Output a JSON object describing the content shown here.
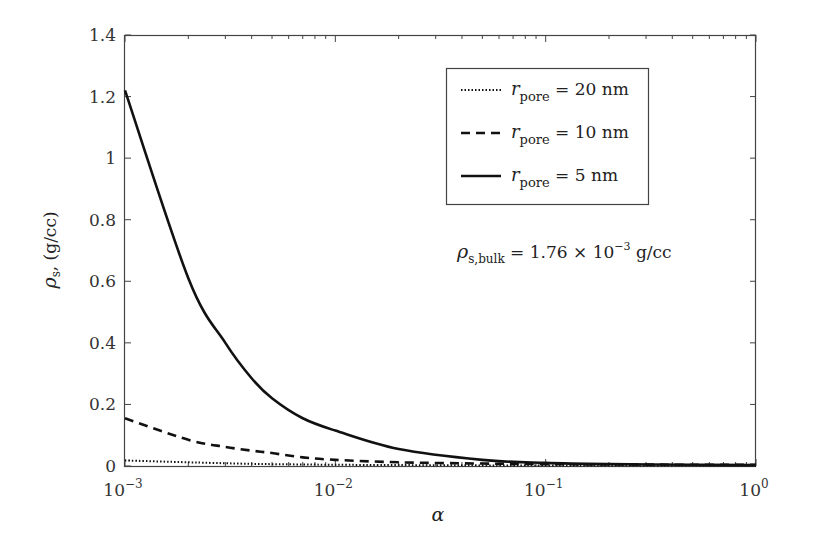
{
  "chart_data": {
    "type": "line",
    "title": "",
    "xlabel": "α",
    "ylabel": "ρs, (g/cc)",
    "xscale": "log",
    "xlim": [
      0.001,
      1
    ],
    "ylim": [
      0,
      1.4
    ],
    "grid": false,
    "legend_position": "upper right (inside)",
    "x_ticks": [
      {
        "value": 0.001,
        "base": "10",
        "exp": "−3"
      },
      {
        "value": 0.01,
        "base": "10",
        "exp": "−2"
      },
      {
        "value": 0.1,
        "base": "10",
        "exp": "−1"
      },
      {
        "value": 1,
        "base": "10",
        "exp": "0"
      }
    ],
    "y_ticks": [
      {
        "value": 0,
        "label": "0"
      },
      {
        "value": 0.2,
        "label": "0.2"
      },
      {
        "value": 0.4,
        "label": "0.4"
      },
      {
        "value": 0.6,
        "label": "0.6"
      },
      {
        "value": 0.8,
        "label": "0.8"
      },
      {
        "value": 1.0,
        "label": "1"
      },
      {
        "value": 1.2,
        "label": "1.2"
      },
      {
        "value": 1.4,
        "label": "1.4"
      }
    ],
    "x": [
      0.001,
      0.002,
      0.003,
      0.004,
      0.005,
      0.007,
      0.01,
      0.02,
      0.05,
      0.1,
      0.2,
      0.5,
      1
    ],
    "series": [
      {
        "name": "r_pore = 20 nm",
        "legend_main": "r",
        "legend_sub": "pore",
        "legend_rest": " = 20 nm",
        "style": "dotted",
        "values": [
          0.018,
          0.012,
          0.009,
          0.007,
          0.006,
          0.005,
          0.004,
          0.003,
          0.002,
          0.002,
          0.002,
          0.002,
          0.002
        ]
      },
      {
        "name": "r_pore = 10 nm",
        "legend_main": "r",
        "legend_sub": "pore",
        "legend_rest": " = 10 nm",
        "style": "dashed",
        "values": [
          0.155,
          0.085,
          0.062,
          0.05,
          0.042,
          0.028,
          0.02,
          0.012,
          0.008,
          0.006,
          0.005,
          0.004,
          0.004
        ]
      },
      {
        "name": "r_pore = 5 nm",
        "legend_main": "r",
        "legend_sub": "pore",
        "legend_rest": " = 5 nm",
        "style": "solid",
        "values": [
          1.22,
          0.61,
          0.4,
          0.285,
          0.22,
          0.155,
          0.115,
          0.055,
          0.02,
          0.01,
          0.006,
          0.004,
          0.003
        ]
      }
    ],
    "annotations": [
      {
        "text_main": "ρ",
        "text_sub": "s,bulk",
        "text_rest": " = 1.76 × 10",
        "text_sup": "−3",
        "text_tail": " g/cc"
      }
    ]
  },
  "labels": {
    "ylabel_rho": "ρ",
    "ylabel_sub": "s",
    "ylabel_rest": ", (g/cc)",
    "xlabel": "α"
  }
}
